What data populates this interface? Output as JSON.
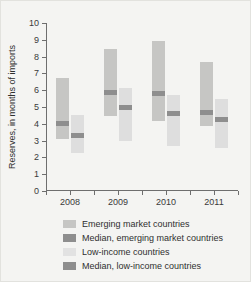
{
  "chart_data": {
    "type": "bar",
    "title": "",
    "xlabel": "",
    "ylabel": "Reserves, in months of imports",
    "categories": [
      "2008",
      "2009",
      "2010",
      "2011"
    ],
    "ylim": [
      0,
      10
    ],
    "yticks": [
      0,
      1,
      2,
      3,
      4,
      5,
      6,
      7,
      8,
      9,
      10
    ],
    "grid": false,
    "legend_position": "bottom",
    "series": [
      {
        "name": "Emerging market countries",
        "kind": "range",
        "color": "#c6c6c4",
        "low": [
          3.1,
          4.45,
          4.15,
          3.85
        ],
        "high": [
          6.7,
          8.45,
          8.9,
          7.7
        ]
      },
      {
        "name": "Median, emerging market countries",
        "kind": "median",
        "color": "#8e8e8e",
        "values": [
          4.0,
          5.85,
          5.8,
          4.7
        ]
      },
      {
        "name": "Low-income countries",
        "kind": "range",
        "color": "#dedede",
        "low": [
          2.25,
          3.0,
          2.65,
          2.55
        ],
        "high": [
          4.5,
          6.15,
          5.7,
          5.5
        ]
      },
      {
        "name": "Median, low-income countries",
        "kind": "median",
        "color": "#8e8e8e",
        "values": [
          3.3,
          5.0,
          4.6,
          4.25
        ]
      }
    ]
  },
  "axis": {
    "y_tick_labels": [
      "0",
      "1",
      "2",
      "3",
      "4",
      "5",
      "6",
      "7",
      "8",
      "9",
      "10"
    ],
    "y_title": "Reserves, in months of imports",
    "x_tick_labels": [
      "2008",
      "2009",
      "2010",
      "2011"
    ]
  },
  "legend": {
    "items": [
      {
        "label": "Emerging market countries",
        "swatch": "sw-em"
      },
      {
        "label": "Median, emerging market countries",
        "swatch": "sw-em-med"
      },
      {
        "label": "Low-income countries",
        "swatch": "sw-li"
      },
      {
        "label": "Median, low-income countries",
        "swatch": "sw-li-med"
      }
    ]
  }
}
